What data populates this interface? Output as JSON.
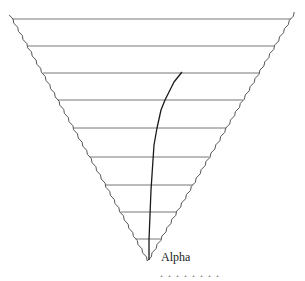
{
  "diagram": {
    "type": "inverted-triangle-with-path",
    "triangle": {
      "top_left": [
        10,
        15
      ],
      "top_right": [
        295,
        12
      ],
      "apex": [
        148,
        261
      ],
      "edge_color": "#555555"
    },
    "horizontal_lines_y": [
      19,
      46,
      73,
      100,
      128,
      157,
      185,
      212,
      239
    ],
    "line_color": "#777777",
    "path": {
      "color": "#1a1a1a",
      "points": [
        [
          149,
          260
        ],
        [
          149,
          240
        ],
        [
          150,
          215
        ],
        [
          151,
          190
        ],
        [
          153,
          160
        ],
        [
          154,
          145
        ],
        [
          157,
          128
        ],
        [
          161,
          110
        ],
        [
          165,
          100
        ],
        [
          170,
          90
        ],
        [
          174,
          82
        ],
        [
          178,
          77
        ],
        [
          182,
          72
        ]
      ]
    },
    "label": {
      "text": "Alpha",
      "x": 161,
      "y": 250
    },
    "cutoff_text": ". . .  .   .     .  .  ."
  }
}
